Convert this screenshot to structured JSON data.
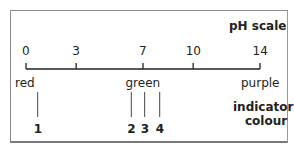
{
  "title": "pH scale",
  "scale": {
    "ticks": [
      {
        "label": "0",
        "value": 0
      },
      {
        "label": "3",
        "value": 3
      },
      {
        "label": "7",
        "value": 7
      },
      {
        "label": "10",
        "value": 10
      },
      {
        "label": "14",
        "value": 14
      }
    ],
    "range": [
      0,
      14
    ]
  },
  "colours": [
    {
      "label": "red",
      "ph": 0.7
    },
    {
      "label": "green",
      "ph": 7
    },
    {
      "label": "purple",
      "ph": 14
    }
  ],
  "indicator_label_line1": "indicator",
  "indicator_label_line2": "colour",
  "indicators": [
    {
      "label": "1",
      "ph": 0.7
    },
    {
      "label": "2",
      "ph": 6.3
    },
    {
      "label": "3",
      "ph": 7.1
    },
    {
      "label": "4",
      "ph": 8.0
    }
  ]
}
